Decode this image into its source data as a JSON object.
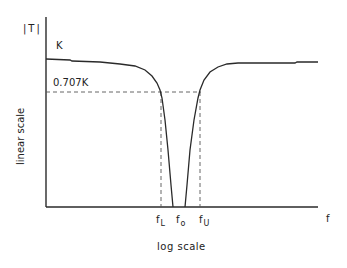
{
  "diagram": {
    "y_axis_title": "|T|",
    "y_axis_scale_label": "linear scale",
    "x_axis_title": "f",
    "x_axis_scale_label": "log scale",
    "level_k_label": "K",
    "level_707_label": "0.707K",
    "freq_labels": [
      {
        "main": "f",
        "sub": "L"
      },
      {
        "main": "f",
        "sub": "o"
      },
      {
        "main": "f",
        "sub": "U"
      }
    ],
    "colors": {
      "line": "#2a2a2a",
      "dashed": "#555555",
      "background": "#ffffff"
    }
  }
}
